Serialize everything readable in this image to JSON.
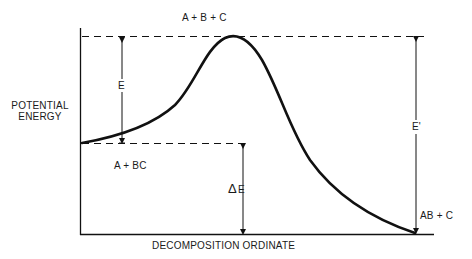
{
  "diagram": {
    "type": "potential_energy_reaction_profile",
    "y_axis_label_line1": "POTENTIAL",
    "y_axis_label_line2": "ENERGY",
    "x_axis_label": "DECOMPOSITION ORDINATE",
    "labels": {
      "transition_state": "A  +  B  +  C",
      "reactants": "A + BC",
      "products": "AB + C",
      "activation_energy": "E",
      "activation_energy_reverse": "E'",
      "reaction_energy_delta": "E",
      "delta_symbol": "Δ"
    },
    "colors": {
      "line": "#111111",
      "background": "#ffffff"
    }
  }
}
